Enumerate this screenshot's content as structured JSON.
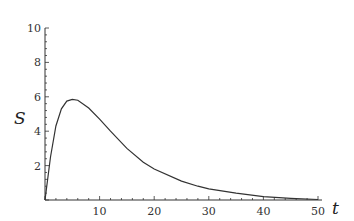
{
  "chart_data": {
    "type": "line",
    "title": "",
    "xlabel": "t",
    "ylabel": "S",
    "xlim": [
      0,
      50
    ],
    "ylim": [
      0,
      10
    ],
    "grid": false,
    "legend": null,
    "x_ticks": [
      10,
      20,
      30,
      40,
      50
    ],
    "y_ticks": [
      2,
      4,
      6,
      8,
      10
    ],
    "series": [
      {
        "name": "S(t)",
        "color": "#333333",
        "x": [
          0,
          1,
          2,
          3,
          4,
          5,
          6,
          8,
          10,
          12,
          15,
          18,
          20,
          25,
          28,
          30,
          35,
          40,
          45,
          50
        ],
        "y": [
          0,
          2.5,
          4.3,
          5.3,
          5.75,
          5.85,
          5.8,
          5.35,
          4.7,
          4.0,
          3.0,
          2.2,
          1.8,
          1.1,
          0.8,
          0.65,
          0.4,
          0.2,
          0.1,
          0.03
        ]
      }
    ]
  },
  "labels": {
    "x_axis": "t",
    "y_axis": "S",
    "x_tick_labels": [
      "10",
      "20",
      "30",
      "40",
      "50"
    ],
    "y_tick_labels": [
      "2",
      "4",
      "6",
      "8",
      "10"
    ]
  }
}
